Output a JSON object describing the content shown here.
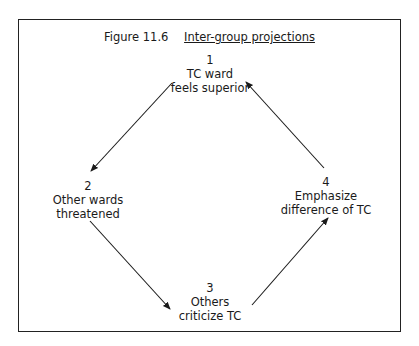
{
  "figure": {
    "number": "Figure 11.6",
    "title": "Inter-group projections"
  },
  "nodes": [
    {
      "num": "1",
      "line1": "TC ward",
      "line2": "feels superior"
    },
    {
      "num": "2",
      "line1": "Other wards",
      "line2": "threatened"
    },
    {
      "num": "3",
      "line1": "Others",
      "line2": "criticize TC"
    },
    {
      "num": "4",
      "line1": "Emphasize",
      "line2": "difference of TC"
    }
  ],
  "edges": [
    {
      "from": "1",
      "to": "2"
    },
    {
      "from": "2",
      "to": "3"
    },
    {
      "from": "3",
      "to": "4"
    },
    {
      "from": "4",
      "to": "1"
    }
  ],
  "colors": {
    "ink": "#1a1a1a",
    "background": "#ffffff"
  }
}
